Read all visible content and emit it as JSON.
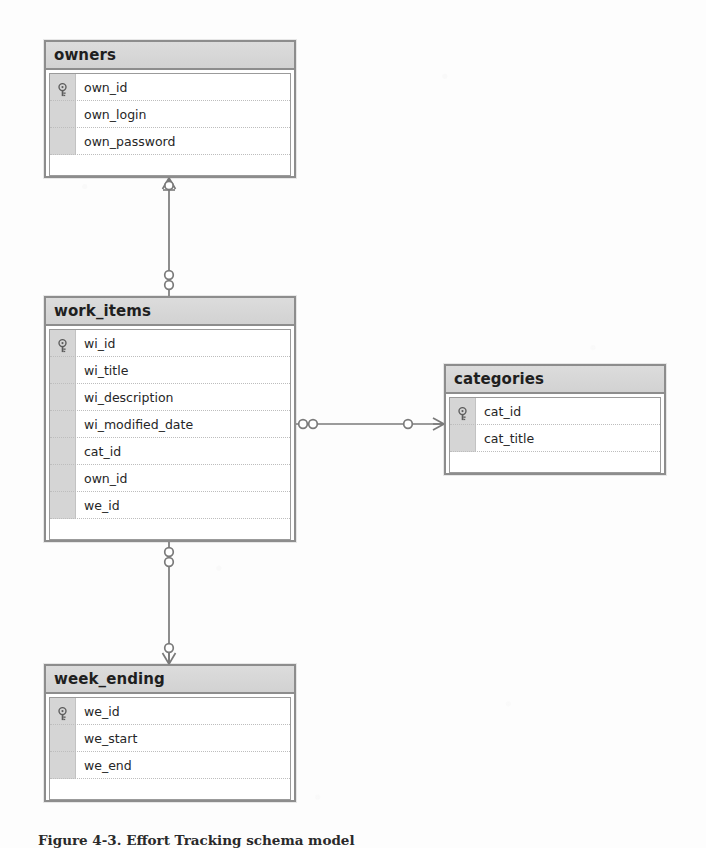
{
  "diagram": {
    "type": "entity-relationship-diagram",
    "notation": "crow's foot",
    "caption": "Figure 4-3. Effort Tracking schema model",
    "entities": [
      {
        "id": "owners",
        "name": "owners",
        "x": 44,
        "y": 40,
        "width": 252,
        "height": 138,
        "attributes": [
          {
            "name": "own_id",
            "primary_key": true
          },
          {
            "name": "own_login",
            "primary_key": false
          },
          {
            "name": "own_password",
            "primary_key": false
          }
        ]
      },
      {
        "id": "work_items",
        "name": "work_items",
        "x": 44,
        "y": 296,
        "width": 252,
        "height": 246,
        "attributes": [
          {
            "name": "wi_id",
            "primary_key": true
          },
          {
            "name": "wi_title",
            "primary_key": false
          },
          {
            "name": "wi_description",
            "primary_key": false
          },
          {
            "name": "wi_modified_date",
            "primary_key": false
          },
          {
            "name": "cat_id",
            "primary_key": false
          },
          {
            "name": "own_id",
            "primary_key": false
          },
          {
            "name": "we_id",
            "primary_key": false
          }
        ]
      },
      {
        "id": "categories",
        "name": "categories",
        "x": 444,
        "y": 364,
        "width": 222,
        "height": 111,
        "attributes": [
          {
            "name": "cat_id",
            "primary_key": true
          },
          {
            "name": "cat_title",
            "primary_key": false
          }
        ]
      },
      {
        "id": "week_ending",
        "name": "week_ending",
        "x": 44,
        "y": 664,
        "width": 252,
        "height": 138,
        "attributes": [
          {
            "name": "we_id",
            "primary_key": true
          },
          {
            "name": "we_start",
            "primary_key": false
          },
          {
            "name": "we_end",
            "primary_key": false
          }
        ]
      }
    ],
    "relationships": [
      {
        "id": "owners-work_items",
        "from": "owners",
        "to": "work_items",
        "from_cardinality": "one-and-only-one",
        "to_cardinality": "zero-or-many"
      },
      {
        "id": "work_items-categories",
        "from": "work_items",
        "to": "categories",
        "from_cardinality": "zero-or-many",
        "to_cardinality": "one-and-only-one"
      },
      {
        "id": "work_items-week_ending",
        "from": "work_items",
        "to": "week_ending",
        "from_cardinality": "zero-or-many",
        "to_cardinality": "one-and-only-one"
      }
    ],
    "colors": {
      "entity_border": "#8d8d8d",
      "entity_header_fill": "#d7d7d7",
      "entity_body_fill": "#ffffff",
      "gutter_fill": "#d5d5d5",
      "connector_line": "#7a7a7a",
      "text": "#262626",
      "page_background": "#fdfdfd"
    },
    "icons": {
      "primary_key": "key-icon"
    }
  }
}
